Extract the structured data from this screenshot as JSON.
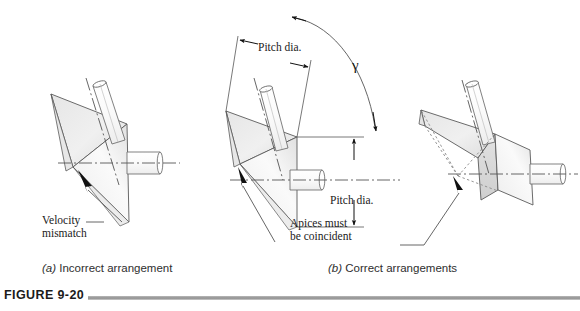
{
  "figure": {
    "number_label": "FIGURE 9-20",
    "domain": "Diagram",
    "background_color": "#ffffff",
    "line_color": "#4a4a4a",
    "fill_light": "#f2f2f2",
    "fill_mid": "#e3e3e3",
    "fill_dark": "#d2d2d2",
    "rule_color": "#8f8f8f",
    "accent_black": "#111111"
  },
  "captions": {
    "a_marker": "(a)",
    "a_text": "Incorrect arrangement",
    "b_marker": "(b)",
    "b_text": "Correct arrangements"
  },
  "annotations": {
    "velocity_mismatch_line1": "Velocity",
    "velocity_mismatch_line2": "mismatch",
    "apices_line1": "Apices must",
    "apices_line2": "be coincident",
    "pitch_dia_top": "Pitch dia.",
    "pitch_dia_right": "Pitch dia.",
    "gamma_symbol": "γ"
  },
  "assemblies": [
    {
      "id": "left-incorrect",
      "name": "Incorrect arrangement assembly",
      "apex_coincident": false,
      "cone_count": 2,
      "shaft_count": 2,
      "has_dotted_extensions": false
    },
    {
      "id": "middle-correct",
      "name": "Correct arrangement assembly with pitch dia. dimensions",
      "apex_coincident": true,
      "cone_count": 2,
      "shaft_count": 2,
      "has_dotted_extensions": false
    },
    {
      "id": "right-correct",
      "name": "Correct arrangement assembly with truncated cones",
      "apex_coincident": true,
      "cone_count": 2,
      "shaft_count": 2,
      "has_dotted_extensions": true
    }
  ]
}
